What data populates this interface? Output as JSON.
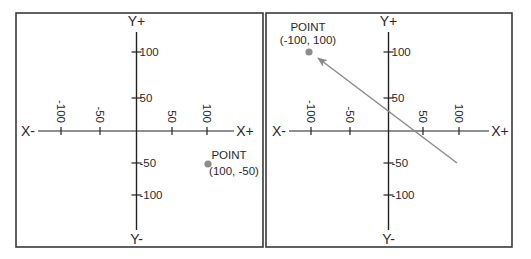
{
  "style": {
    "frame_color": "#3a3a3a",
    "axis_color": "#222222",
    "point_color": "#8c8c8c",
    "arrow_color": "#8a8a8a",
    "text_color": "#2a2a2a"
  },
  "panels": [
    {
      "name": "left-panel",
      "frame": {
        "x": 16,
        "y": 13,
        "w": 247,
        "h": 234
      },
      "axes": {
        "origin": {
          "x": 136.5,
          "y": 131
        },
        "x_axis": {
          "x1": 38,
          "x2": 234
        },
        "y_axis": {
          "y1": 32,
          "y2": 230
        },
        "labels": {
          "x_neg": {
            "text": "X-",
            "x": 28,
            "y": 136
          },
          "x_pos": {
            "text": "X+",
            "x": 245,
            "y": 136
          },
          "y_pos": {
            "text": "Y+",
            "x": 136.5,
            "y": 26
          },
          "y_neg": {
            "text": "Y-",
            "x": 136.5,
            "y": 244
          }
        }
      },
      "x_ticks": [
        {
          "label": "-100",
          "x": 61
        },
        {
          "label": "-50",
          "x": 100
        },
        {
          "label": "50",
          "x": 172
        },
        {
          "label": "100",
          "x": 207
        }
      ],
      "y_ticks": [
        {
          "label": "100",
          "y": 52
        },
        {
          "label": "50",
          "y": 98
        },
        {
          "label": "-50",
          "y": 163
        },
        {
          "label": "-100",
          "y": 195
        }
      ],
      "point": {
        "cx": 208,
        "cy": 164,
        "r": 3.6,
        "title": "POINT",
        "coords": "(100, -50)",
        "title_pos": {
          "x": 229,
          "y": 159,
          "anchor": "middle"
        },
        "coords_pos": {
          "x": 234,
          "y": 175,
          "anchor": "middle"
        }
      },
      "arrow": null
    },
    {
      "name": "right-panel",
      "frame": {
        "x": 266,
        "y": 13,
        "w": 246,
        "h": 234
      },
      "axes": {
        "origin": {
          "x": 388.5,
          "y": 131
        },
        "x_axis": {
          "x1": 289,
          "x2": 489
        },
        "y_axis": {
          "y1": 32,
          "y2": 230
        },
        "labels": {
          "x_neg": {
            "text": "X-",
            "x": 279,
            "y": 136
          },
          "x_pos": {
            "text": "X+",
            "x": 500,
            "y": 136
          },
          "y_pos": {
            "text": "Y+",
            "x": 388.5,
            "y": 26
          },
          "y_neg": {
            "text": "Y-",
            "x": 388.5,
            "y": 244
          }
        }
      },
      "x_ticks": [
        {
          "label": "-100",
          "x": 311
        },
        {
          "label": "-50",
          "x": 350
        },
        {
          "label": "50",
          "x": 423
        },
        {
          "label": "100",
          "x": 459
        }
      ],
      "y_ticks": [
        {
          "label": "100",
          "y": 52
        },
        {
          "label": "50",
          "y": 98
        },
        {
          "label": "-50",
          "y": 163
        },
        {
          "label": "-100",
          "y": 195
        }
      ],
      "point": {
        "cx": 309,
        "cy": 52,
        "r": 3.6,
        "title": "POINT",
        "coords": "(-100, 100)",
        "title_pos": {
          "x": 308,
          "y": 31,
          "anchor": "middle"
        },
        "coords_pos": {
          "x": 308,
          "y": 44,
          "anchor": "middle"
        }
      },
      "arrow": {
        "x1": 457,
        "y1": 163,
        "x2": 318,
        "y2": 58
      }
    }
  ]
}
